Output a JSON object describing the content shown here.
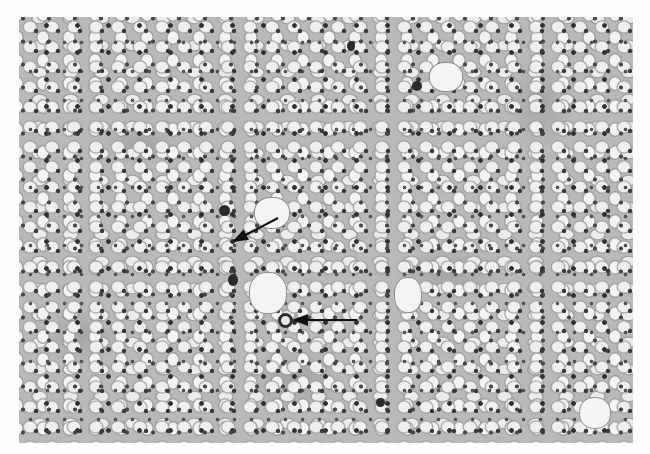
{
  "figure": {
    "type": "histology micrograph",
    "color_mode": "grayscale",
    "bounds": {
      "x": 19,
      "y": 17,
      "width": 614,
      "height": 426
    },
    "background_color": "#fdfdfd",
    "tissue_tone": "#b9b9b9",
    "nucleus_tone": "#333333"
  },
  "annotations": {
    "arrows": [
      {
        "id": "arrow-1",
        "from": [
          278,
          218
        ],
        "to": [
          232,
          242
        ],
        "color": "#111111",
        "target": "cell with clear cytoplasm adjacent to dark nucleus"
      },
      {
        "id": "arrow-2",
        "from": [
          357,
          320
        ],
        "to": [
          292,
          320
        ],
        "color": "#111111",
        "target": "ring-shaped (target-like) inclusion body"
      }
    ]
  }
}
